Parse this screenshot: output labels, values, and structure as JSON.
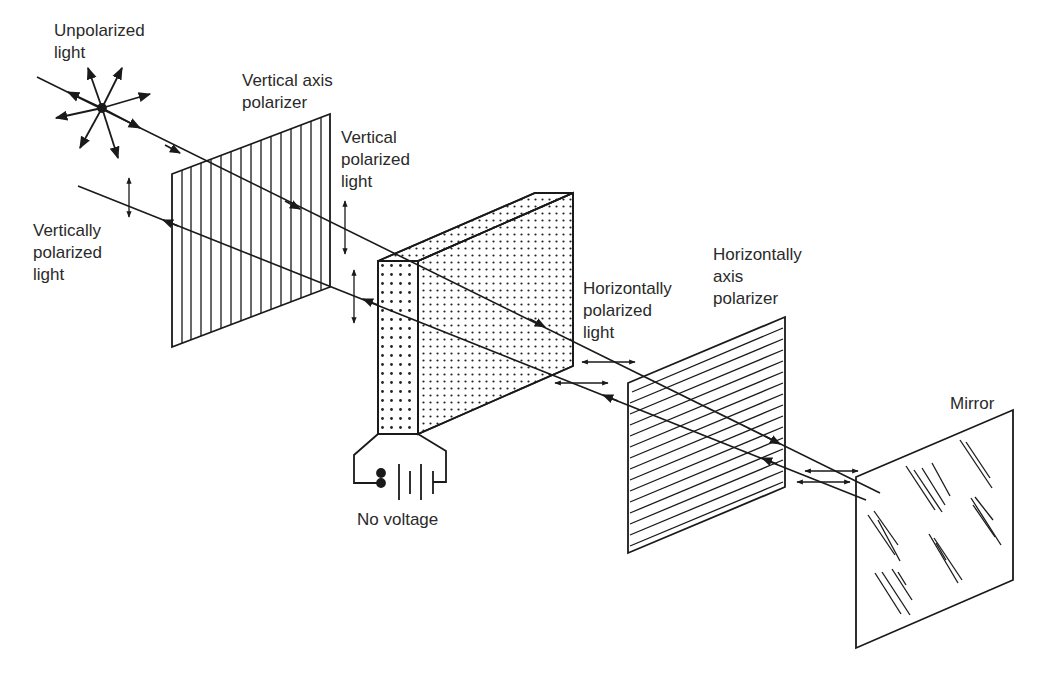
{
  "labels": {
    "unpolarized": "Unpolarized\nlight",
    "vertical_axis_polarizer": "Vertical axis\npolarizer",
    "vertical_polarized": "Vertical\npolarized\nlight",
    "vertically_polarized": "Vertically\npolarized\nlight",
    "horizontally_polarized": "Horizontally\npolarized\nlight",
    "horizontal_axis_polarizer": "Horizontally\naxis\npolarizer",
    "mirror": "Mirror",
    "no_voltage": "No voltage"
  },
  "colors": {
    "ink": "#1a1a1a",
    "background": "#ffffff"
  }
}
